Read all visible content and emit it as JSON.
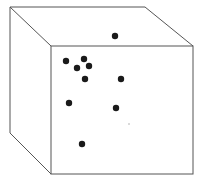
{
  "diagram": {
    "type": "cube-with-points",
    "colors": {
      "edge": "#555555",
      "point": "#1a1a1a",
      "speck": "#9a9a9a",
      "background": "#ffffff"
    },
    "cube": {
      "front_face": {
        "x1": 51,
        "y1": 46,
        "x2": 193,
        "y2": 174
      },
      "back_top_left": [
        10,
        7
      ],
      "back_top_right": [
        145,
        7
      ],
      "back_bottom_left": [
        10,
        133
      ]
    },
    "points": [
      {
        "x": 115,
        "y": 36,
        "r": 3.2
      },
      {
        "x": 66,
        "y": 61,
        "r": 3.2
      },
      {
        "x": 84,
        "y": 59,
        "r": 3.2
      },
      {
        "x": 77,
        "y": 68,
        "r": 3.2
      },
      {
        "x": 89,
        "y": 66,
        "r": 3.2
      },
      {
        "x": 85,
        "y": 79,
        "r": 3.2
      },
      {
        "x": 121,
        "y": 79,
        "r": 3.2
      },
      {
        "x": 69,
        "y": 103,
        "r": 3.2
      },
      {
        "x": 116,
        "y": 108,
        "r": 3.2
      },
      {
        "x": 82,
        "y": 144,
        "r": 3.2
      }
    ],
    "speck": {
      "x": 129,
      "y": 124,
      "r": 0.7
    }
  }
}
